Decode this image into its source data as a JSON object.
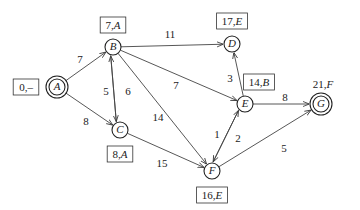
{
  "diagram": {
    "type": "weighted directed graph (shortest path labels)",
    "nodes": [
      {
        "id": "A",
        "x": 57,
        "y": 87,
        "double": true,
        "label": "0,–",
        "label_x": 26,
        "label_y": 87,
        "boxed": true
      },
      {
        "id": "B",
        "x": 113,
        "y": 47,
        "double": false,
        "label": "7,A",
        "label_x": 113,
        "label_y": 25,
        "boxed": true
      },
      {
        "id": "C",
        "x": 120,
        "y": 130,
        "double": false,
        "label": "8,A",
        "label_x": 120,
        "label_y": 154,
        "boxed": true
      },
      {
        "id": "D",
        "x": 232,
        "y": 44,
        "double": false,
        "label": "17,E",
        "label_x": 232,
        "label_y": 21,
        "boxed": true
      },
      {
        "id": "E",
        "x": 245,
        "y": 104,
        "double": false,
        "label": "14,B",
        "label_x": 259,
        "label_y": 82,
        "boxed": true
      },
      {
        "id": "F",
        "x": 212,
        "y": 171,
        "double": false,
        "label": "16,E",
        "label_x": 212,
        "label_y": 195,
        "boxed": true
      },
      {
        "id": "G",
        "x": 321,
        "y": 104,
        "double": true,
        "label": "21,F",
        "label_x": 323,
        "label_y": 84,
        "boxed": false
      }
    ],
    "edges": [
      {
        "from": "A",
        "to": "B",
        "weight": "7",
        "wx": 80,
        "wy": 60
      },
      {
        "from": "A",
        "to": "C",
        "weight": "8",
        "wx": 86,
        "wy": 122
      },
      {
        "from": "C",
        "to": "B",
        "weight": "5",
        "wx": 106,
        "wy": 92,
        "offset": -3
      },
      {
        "from": "B",
        "to": "C",
        "weight": "6",
        "wx": 128,
        "wy": 92,
        "offset": 3
      },
      {
        "from": "B",
        "to": "D",
        "weight": "11",
        "wx": 170,
        "wy": 35
      },
      {
        "from": "B",
        "to": "E",
        "weight": "7",
        "wx": 176,
        "wy": 86
      },
      {
        "from": "B",
        "to": "F",
        "weight": "14",
        "wx": 158,
        "wy": 118
      },
      {
        "from": "C",
        "to": "F",
        "weight": "15",
        "wx": 162,
        "wy": 164
      },
      {
        "from": "E",
        "to": "D",
        "weight": "3",
        "wx": 230,
        "wy": 79
      },
      {
        "from": "E",
        "to": "G",
        "weight": "8",
        "wx": 285,
        "wy": 98
      },
      {
        "from": "F",
        "to": "E",
        "weight": "1",
        "wx": 217,
        "wy": 135,
        "offset": -3
      },
      {
        "from": "E",
        "to": "F",
        "weight": "2",
        "wx": 238,
        "wy": 139,
        "offset": 3
      },
      {
        "from": "F",
        "to": "G",
        "weight": "5",
        "wx": 284,
        "wy": 149
      }
    ]
  },
  "colors": {
    "stroke": "#222222",
    "background": "#ffffff"
  }
}
